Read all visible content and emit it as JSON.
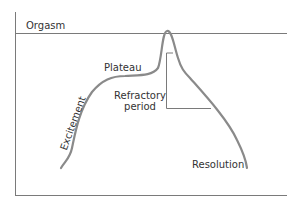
{
  "diagram": {
    "type": "sexual-response-cycle",
    "labels": {
      "orgasm": "Orgasm",
      "plateau": "Plateau",
      "excitement": "Excitement",
      "refractory_line1": "Refractory",
      "refractory_line2": "period",
      "resolution": "Resolution"
    },
    "colors": {
      "curve": "#8a8a8a",
      "axes": "#7a7a7a",
      "text": "#333333"
    }
  }
}
